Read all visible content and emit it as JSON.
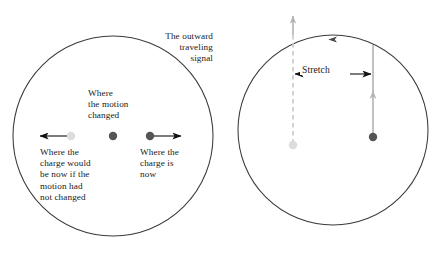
{
  "figure": {
    "background_color": "#ffffff",
    "width": 445,
    "height": 254
  },
  "colors": {
    "stroke_dark": "#3a3a3a",
    "text": "#1a1a1a",
    "dot_dark": "#555555",
    "dot_light": "#d9d9d9",
    "arrow_gray": "#b3b3b3",
    "arrow_black": "#111111"
  },
  "left_panel": {
    "name": "signal-sphere-panel",
    "circle": {
      "cx": 113,
      "cy": 136,
      "r": 100,
      "label": "outward traveling signal wavefront"
    },
    "labels": {
      "outward_signal": "The outward\ntraveling\nsignal",
      "motion_changed": "Where\nthe motion\nchanged",
      "charge_would_be": "Where the\ncharge would\nbe now if the\nmotion had\nnot changed",
      "charge_is_now": "Where the\ncharge is\nnow"
    },
    "markers": {
      "origin_dot": {
        "cx": 113,
        "cy": 136,
        "r": 4.2,
        "shade": "dark"
      },
      "ghost_charge_dot": {
        "cx": 71,
        "cy": 136,
        "r": 4.2,
        "shade": "light"
      },
      "actual_charge_dot": {
        "cx": 150,
        "cy": 136,
        "r": 4.2,
        "shade": "dark"
      }
    },
    "arrows": {
      "ghost_velocity": {
        "from_x": 71,
        "to_x": 38,
        "y": 136,
        "direction": "left"
      },
      "actual_velocity": {
        "from_x": 150,
        "to_x": 183,
        "y": 136,
        "direction": "right"
      }
    }
  },
  "right_panel": {
    "name": "field-line-stretch-panel",
    "circle": {
      "cx": 333,
      "cy": 130,
      "r": 95,
      "label": "outward traveling signal wavefront"
    },
    "labels": {
      "stretch": "Stretch"
    },
    "markers": {
      "ghost_charge_dot": {
        "cx": 293,
        "cy": 145,
        "r": 4.2,
        "shade": "light"
      },
      "actual_charge_dot": {
        "cx": 373,
        "cy": 137,
        "r": 4.2,
        "shade": "dark"
      }
    },
    "field_lines": {
      "ghost_field_line": {
        "x": 293,
        "top_y": 13,
        "bottom_y": 145,
        "style": "dashed-above-circle-solid"
      },
      "actual_field_line": {
        "x": 373,
        "top_y": 45,
        "bottom_y": 137,
        "style": "solid"
      }
    },
    "arrows": {
      "ghost_field_tip": {
        "x": 293,
        "y": 13,
        "direction": "up"
      },
      "actual_field_tip": {
        "x": 373,
        "y": 92,
        "direction": "up"
      },
      "wavefront_tip": {
        "x": 331,
        "y": 39,
        "direction": "left"
      },
      "stretch_left": {
        "x": 293,
        "y": 74,
        "direction": "left"
      },
      "stretch_right": {
        "x": 373,
        "y": 74,
        "direction": "right"
      }
    }
  }
}
